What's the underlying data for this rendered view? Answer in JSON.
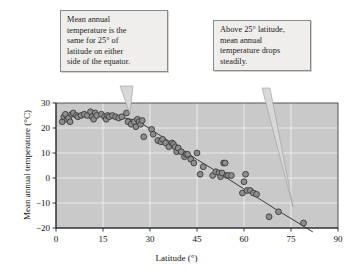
{
  "figure": {
    "background_color": "#ffffff",
    "plot_background_color": "#c9c9c9",
    "grid_color": "#efefef",
    "axis_color": "#333333",
    "marker_fill": "#8e8e8e",
    "marker_stroke": "#3a3a3a",
    "trendline_color": "#2a2a2a",
    "callout_fill": "#f0eeec",
    "callout_border": "#8a8a8a"
  },
  "annotations": {
    "left": {
      "name": "callout-equator-symmetry",
      "text": "Mean annual temperature is the same for 25° of latitude on either side of the equator.",
      "lines": [
        "Mean annual",
        "temperature is the",
        "same for 25° of",
        "latitude on either",
        "side of the equator."
      ]
    },
    "right": {
      "name": "callout-temperature-drop",
      "text": "Above 25° latitude, mean annual temperature drops steadily.",
      "lines": [
        "Above 25° latitude,",
        "mean annual",
        "temperature drops",
        "steadily."
      ]
    }
  },
  "chart_data": {
    "type": "scatter",
    "title": "",
    "xlabel": "Latitude (°)",
    "ylabel": "Mean annual temperature (°C)",
    "xlim": [
      0,
      90
    ],
    "ylim": [
      -20,
      30
    ],
    "xticks": [
      0,
      15,
      30,
      45,
      60,
      75,
      90
    ],
    "xticklabels": [
      "0",
      "15",
      "30",
      "45",
      "60",
      "75",
      "90"
    ],
    "yticks": [
      -20,
      -10,
      0,
      10,
      20,
      30
    ],
    "yticklabels": [
      "−20",
      "−10",
      "0",
      "10",
      "20",
      "30"
    ],
    "grid": true,
    "grid_axis": "both",
    "legend": null,
    "series": [
      {
        "name": "Mean annual temperature vs latitude",
        "marker": "circle",
        "x": [
          2,
          2.5,
          3,
          3.5,
          4,
          4.5,
          5,
          5.5,
          6.5,
          7,
          8,
          9,
          10,
          11,
          11.5,
          12,
          12.5,
          13,
          14.5,
          15.5,
          16,
          16.5,
          17,
          18,
          19,
          20,
          21,
          22.5,
          23,
          24,
          25,
          25.5,
          26,
          26.5,
          27,
          27.5,
          28,
          30.5,
          31,
          32.5,
          33.5,
          34,
          35,
          36,
          37,
          37.5,
          38,
          38.5,
          39,
          40,
          41,
          41.5,
          42,
          43,
          44,
          45,
          46,
          47,
          50,
          51,
          52,
          52.5,
          53,
          53.5,
          54,
          54.5,
          55,
          56,
          59.5,
          60,
          60.5,
          61,
          62,
          63,
          64,
          68,
          71,
          79
        ],
        "y": [
          22.5,
          24.5,
          25.5,
          23.5,
          24,
          22.5,
          25.5,
          26,
          25,
          24.5,
          25,
          25.5,
          25,
          26.5,
          24.5,
          23.5,
          26,
          25,
          25.5,
          24.5,
          23.5,
          25,
          24.5,
          25,
          24.5,
          24,
          24.5,
          26,
          22.5,
          21.5,
          22.5,
          20.5,
          23.5,
          22.5,
          21.5,
          23,
          16.5,
          19.5,
          17.5,
          15,
          14.5,
          15.5,
          14,
          12.5,
          14,
          13.5,
          12.5,
          10.5,
          12,
          10.5,
          8.5,
          9.5,
          9.5,
          7.5,
          6,
          10,
          1.5,
          4.5,
          1,
          2.5,
          2,
          0.5,
          2,
          6,
          6,
          1,
          1,
          1,
          -6,
          -1.5,
          1.5,
          -5,
          -5,
          -6,
          -6.5,
          -15.5,
          -13.5,
          -18
        ]
      }
    ],
    "trendline": {
      "name": "fitted-trend-line",
      "type": "smooth",
      "points": [
        [
          14,
          25.0
        ],
        [
          18,
          24.7
        ],
        [
          22,
          24.0
        ],
        [
          25,
          23.2
        ],
        [
          28,
          21.3
        ],
        [
          32,
          18.0
        ],
        [
          36,
          14.8
        ],
        [
          40,
          11.6
        ],
        [
          45,
          7.4
        ],
        [
          50,
          3.6
        ],
        [
          55,
          -0.4
        ],
        [
          60,
          -4.4
        ],
        [
          65,
          -8.4
        ],
        [
          70,
          -12.4
        ],
        [
          75,
          -16.2
        ],
        [
          82,
          -21.6
        ]
      ]
    }
  }
}
